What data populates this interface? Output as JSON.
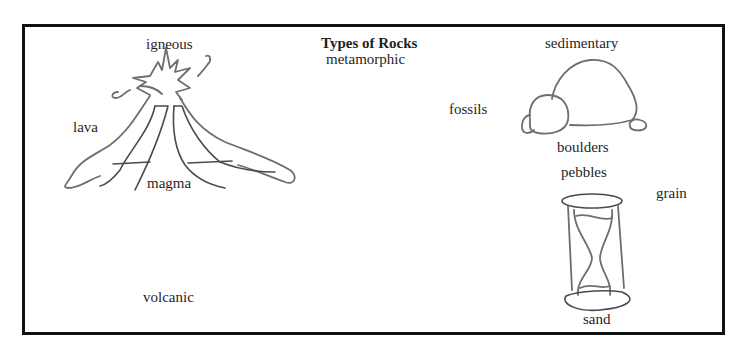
{
  "diagram": {
    "title": "Types of Rocks",
    "labels": {
      "igneous": "igneous",
      "metamorphic": "metamorphic",
      "sedimentary": "sedimentary",
      "lava": "lava",
      "magma": "magma",
      "volcanic": "volcanic",
      "fossils": "fossils",
      "boulders": "boulders",
      "pebbles": "pebbles",
      "grain": "grain",
      "sand": "sand"
    },
    "illustrations": [
      {
        "name": "volcano-drawing",
        "description": "pencil sketch of an erupting volcano"
      },
      {
        "name": "boulders-drawing",
        "description": "pencil sketch of a large rock with smaller rocks"
      },
      {
        "name": "hourglass-drawing",
        "description": "pencil sketch of an hourglass with sand"
      }
    ],
    "colors": {
      "border": "#111111",
      "pencil": "#6e6e6e",
      "text": "#1f1f1f",
      "background": "#ffffff"
    }
  }
}
